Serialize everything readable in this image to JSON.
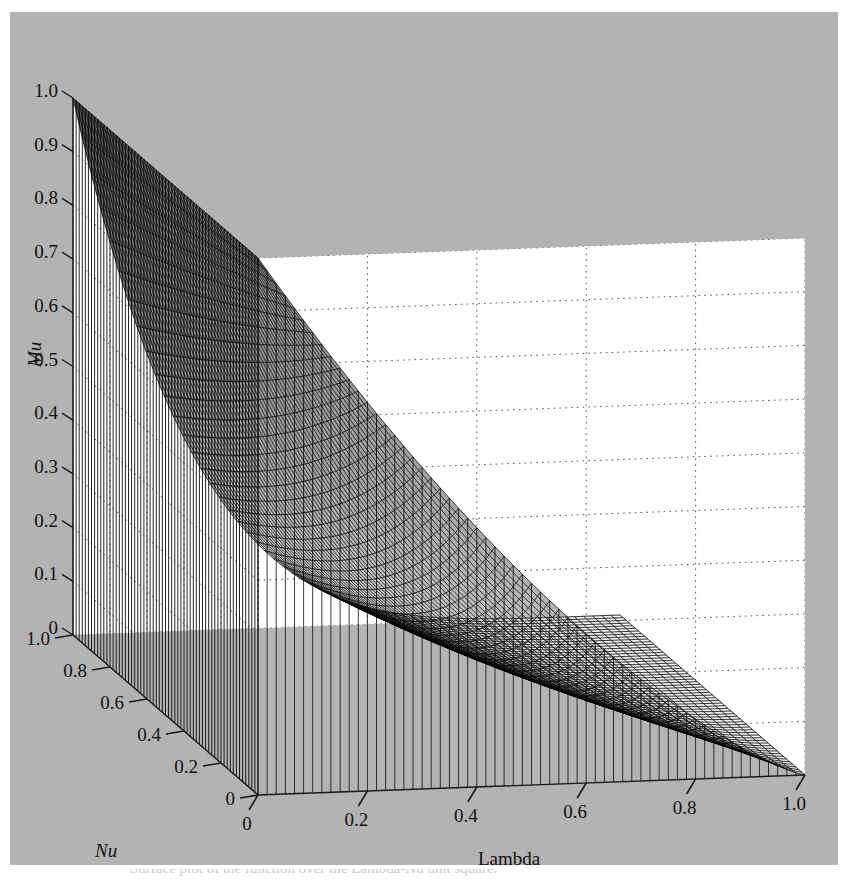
{
  "figure": {
    "title": "",
    "background_color": "#b3b3b3",
    "plot_interior_color": "#ffffff",
    "mesh_color": "#000000",
    "gridline_color": "#555555",
    "caption": "Surface plot of the function over the Lambda-Nu unit square."
  },
  "axes": {
    "vertical": {
      "name": "Mu",
      "italic": true,
      "min": 0,
      "max": 1.0,
      "ticks": [
        {
          "value": 1.0,
          "label": "1.0"
        },
        {
          "value": 0.9,
          "label": "0.9"
        },
        {
          "value": 0.8,
          "label": "0.8"
        },
        {
          "value": 0.7,
          "label": "0.7"
        },
        {
          "value": 0.6,
          "label": "0.6"
        },
        {
          "value": 0.5,
          "label": "0.5"
        },
        {
          "value": 0.4,
          "label": "0.4"
        },
        {
          "value": 0.3,
          "label": "0.3"
        },
        {
          "value": 0.2,
          "label": "0.2"
        },
        {
          "value": 0.1,
          "label": "0.1"
        },
        {
          "value": 0.0,
          "label": "0"
        }
      ]
    },
    "left_depth": {
      "name": "Nu",
      "italic": true,
      "min": 0,
      "max": 1.0,
      "ticks": [
        {
          "value": 1.0,
          "label": "1.0"
        },
        {
          "value": 0.8,
          "label": "0.8"
        },
        {
          "value": 0.6,
          "label": "0.6"
        },
        {
          "value": 0.4,
          "label": "0.4"
        },
        {
          "value": 0.2,
          "label": "0.2"
        },
        {
          "value": 0.0,
          "label": "0"
        }
      ]
    },
    "bottom_width": {
      "name": "Lambda",
      "italic": false,
      "min": 0,
      "max": 1.0,
      "ticks": [
        {
          "value": 0.0,
          "label": "0"
        },
        {
          "value": 0.2,
          "label": "0.2"
        },
        {
          "value": 0.4,
          "label": "0.4"
        },
        {
          "value": 0.6,
          "label": "0.6"
        },
        {
          "value": 0.8,
          "label": "0.8"
        },
        {
          "value": 1.0,
          "label": "1.0"
        }
      ]
    }
  },
  "chart_data": {
    "type": "surface",
    "title": "",
    "xlabel": "Lambda",
    "ylabel": "Nu",
    "zlabel": "Mu",
    "xlim": [
      0,
      1
    ],
    "ylim": [
      0,
      1
    ],
    "zlim": [
      0,
      1
    ],
    "grid": true,
    "legend": "none",
    "projection": {
      "azimuth_deg": 45,
      "elevation_deg": 28,
      "view": "front-corner at origin (Lambda=0, Nu=0), Mu rising vertically"
    },
    "grid_resolution": {
      "n_lambda": 60,
      "n_nu": 60
    },
    "surface_function": "Mu = (1 - lambda)^(1/(nu + 0.02)) blended toward an L-shaped ridge at lambda=0",
    "sample_points": [
      {
        "lambda": 0.0,
        "nu": 0.0,
        "mu": 1.0
      },
      {
        "lambda": 0.0,
        "nu": 0.5,
        "mu": 1.0
      },
      {
        "lambda": 0.0,
        "nu": 1.0,
        "mu": 1.0
      },
      {
        "lambda": 0.2,
        "nu": 0.0,
        "mu": 0.62
      },
      {
        "lambda": 0.2,
        "nu": 0.5,
        "mu": 0.4
      },
      {
        "lambda": 0.2,
        "nu": 1.0,
        "mu": 0.18
      },
      {
        "lambda": 0.4,
        "nu": 0.0,
        "mu": 0.45
      },
      {
        "lambda": 0.4,
        "nu": 0.5,
        "mu": 0.25
      },
      {
        "lambda": 0.4,
        "nu": 1.0,
        "mu": 0.08
      },
      {
        "lambda": 0.6,
        "nu": 0.0,
        "mu": 0.32
      },
      {
        "lambda": 0.6,
        "nu": 0.5,
        "mu": 0.14
      },
      {
        "lambda": 0.6,
        "nu": 1.0,
        "mu": 0.03
      },
      {
        "lambda": 0.8,
        "nu": 0.0,
        "mu": 0.19
      },
      {
        "lambda": 0.8,
        "nu": 0.5,
        "mu": 0.06
      },
      {
        "lambda": 0.8,
        "nu": 1.0,
        "mu": 0.01
      },
      {
        "lambda": 1.0,
        "nu": 0.0,
        "mu": 0.0
      },
      {
        "lambda": 1.0,
        "nu": 0.5,
        "mu": 0.0
      },
      {
        "lambda": 1.0,
        "nu": 1.0,
        "mu": 0.0
      }
    ]
  }
}
